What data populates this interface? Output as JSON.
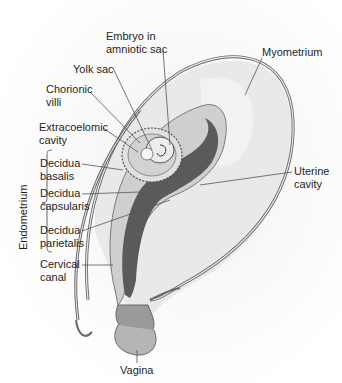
{
  "figure": {
    "labels": {
      "embryo": {
        "line1": "Embryo in",
        "line2": "amniotic sac"
      },
      "yolk_sac": "Yolk sac",
      "chorionic_villi": {
        "line1": "Chorionic",
        "line2": "villi"
      },
      "extracoelomic": {
        "line1": "Extracoelomic",
        "line2": "cavity"
      },
      "decidua_basalis": {
        "line1": "Decidua",
        "line2": "basalis"
      },
      "decidua_capsularis": {
        "line1": "Decidua",
        "line2": "capsularis"
      },
      "decidua_parietalis": {
        "line1": "Decidua",
        "line2": "parietalis"
      },
      "cervical_canal": {
        "line1": "Cervical",
        "line2": "canal"
      },
      "vagina": "Vagina",
      "myometrium": "Myometrium",
      "uterine_cavity": {
        "line1": "Uterine",
        "line2": "cavity"
      },
      "endometrium_bracket": "Endometrium"
    },
    "colors": {
      "wall_outline": "#6a6a6a",
      "myometrium_fill": "#e6e6e6",
      "endometrium_fill": "#c9c9c9",
      "cavity_fill": "#5a5a5a",
      "sac_fill": "#d8d8d8",
      "leader_line": "#555555"
    }
  }
}
